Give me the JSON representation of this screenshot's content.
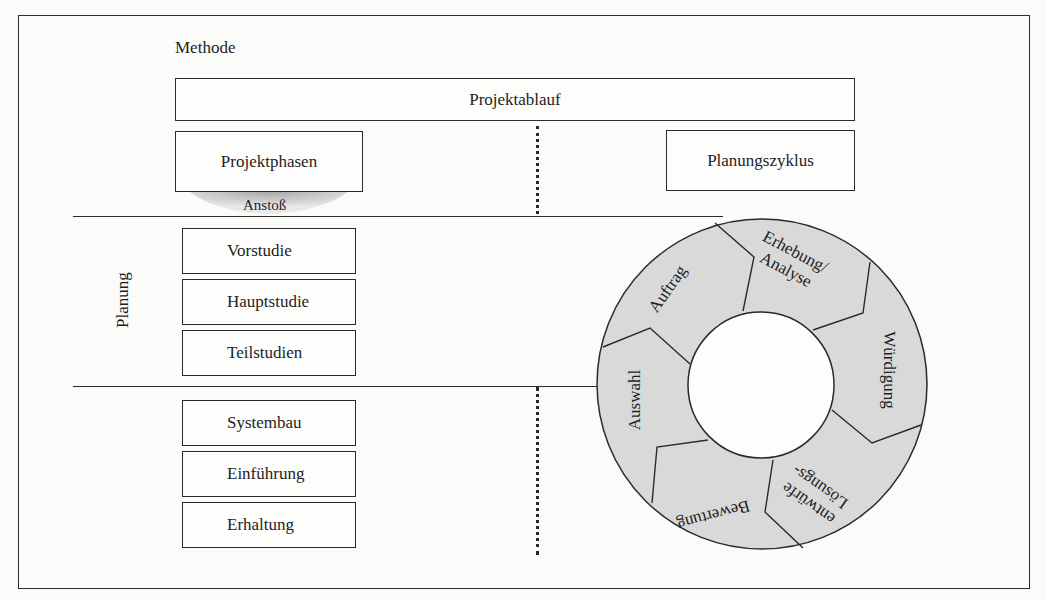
{
  "diagram": {
    "method_label": "Methode",
    "projektablauf": "Projektablauf",
    "projektphasen": "Projektphasen",
    "planungszyklus": "Planungszyklus",
    "anstoss": "Anstoß",
    "planung_label": "Planung",
    "planning_phases": [
      "Vorstudie",
      "Hauptstudie",
      "Teilstudien"
    ],
    "realization_phases": [
      "Systembau",
      "Einführung",
      "Erhaltung"
    ],
    "cycle": {
      "segments": [
        {
          "label": "Auftrag"
        },
        {
          "label_line1": "Erhebung/",
          "label_line2": "Analyse"
        },
        {
          "label": "Würdigung"
        },
        {
          "label_line1": "Lösungs-",
          "label_line2": "entwürfe"
        },
        {
          "label": "Bewertung"
        },
        {
          "label": "Auswahl"
        }
      ],
      "fill_color": "#d9d9d9",
      "line_color": "#2a2a2a"
    }
  }
}
